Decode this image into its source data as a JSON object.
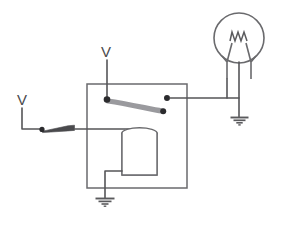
{
  "diagram": {
    "colors": {
      "wire": "#555558",
      "outline": "#6a6a6d",
      "node": "#2b2b2e",
      "armature": "#9a9a9e",
      "label": "#4a4a4d",
      "background": "#ffffff"
    },
    "labels": {
      "supply_top": "V",
      "supply_left": "V"
    },
    "components": {
      "relay_enclosure": {
        "name": "relay-enclosure",
        "x": 87,
        "y": 84,
        "width": 100,
        "height": 104
      },
      "lamp": {
        "name": "lamp",
        "cx": 239,
        "cy": 38,
        "r": 25
      },
      "coil": {
        "name": "relay-coil",
        "x": 122,
        "y": 130,
        "width": 35,
        "height": 45,
        "turns": 22
      },
      "armature": {
        "name": "relay-armature-contact-arm"
      },
      "pivot_contact": {
        "name": "armature-pivot-contact",
        "cx": 107,
        "cy": 99
      },
      "normally_open_contact": {
        "name": "normally-open-contact",
        "cx": 167,
        "cy": 98
      },
      "armature_tip": {
        "name": "armature-tip-contact",
        "cx": 163,
        "cy": 111
      },
      "control_switch": {
        "name": "control-switch",
        "pivot_x": 42,
        "pivot_y": 129
      },
      "ground_lamp": {
        "name": "lamp-ground",
        "x": 246,
        "y": 117
      },
      "ground_coil": {
        "name": "coil-ground",
        "x": 105,
        "y": 198
      }
    }
  }
}
